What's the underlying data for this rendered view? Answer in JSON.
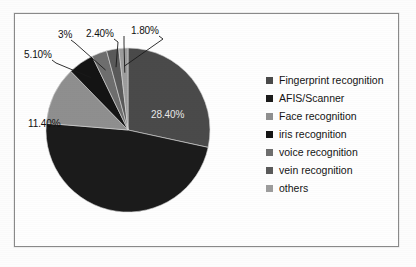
{
  "chart_data": {
    "type": "pie",
    "title": "",
    "legend_position": "right",
    "categories": [
      "Fingerprint recognition",
      "AFIS/Scanner",
      "Face recognition",
      "iris recognition",
      "voice recognition",
      "vein recognition",
      "others"
    ],
    "values": [
      28.4,
      47.9,
      11.4,
      5.1,
      3.0,
      2.4,
      1.8
    ],
    "value_labels": [
      "28.40%",
      "",
      "11.40%",
      "5.10%",
      "3%",
      "2.40%",
      "1.80%"
    ],
    "colors": [
      "#4a4a4a",
      "#1b1b1b",
      "#8f8f8f",
      "#141414",
      "#6e6e6e",
      "#5a5a5a",
      "#9d9d9d"
    ],
    "units": "percent",
    "total": 100
  },
  "chart": {
    "slices": [
      {
        "name": "Fingerprint recognition",
        "value": 28.4,
        "label": "28.40%",
        "color": "#4a4a4a",
        "label_x": 151,
        "label_y": 109,
        "label_placement": "inside"
      },
      {
        "name": "AFIS/Scanner",
        "value": 47.9,
        "label": "",
        "color": "#1b1b1b",
        "label_placement": "none"
      },
      {
        "name": "Face recognition",
        "value": 11.4,
        "label": "11.40%",
        "color": "#8f8f8f",
        "label_x": 28,
        "label_y": 118,
        "label_placement": "outside"
      },
      {
        "name": "iris recognition",
        "value": 5.1,
        "label": "5.10%",
        "color": "#141414",
        "label_x": 24,
        "label_y": 49,
        "label_placement": "outside"
      },
      {
        "name": "voice recognition",
        "value": 3.0,
        "label": "3%",
        "color": "#6e6e6e",
        "label_x": 58,
        "label_y": 29,
        "label_placement": "outside"
      },
      {
        "name": "vein recognition",
        "value": 2.4,
        "label": "2.40%",
        "color": "#5a5a5a",
        "label_x": 86,
        "label_y": 28,
        "label_placement": "outside"
      },
      {
        "name": "others",
        "value": 1.8,
        "label": "1.80%",
        "color": "#9d9d9d",
        "label_x": 131,
        "label_y": 25,
        "label_placement": "outside"
      }
    ]
  },
  "legend": {
    "items": [
      {
        "label": "Fingerprint recognition",
        "color": "#4a4a4a"
      },
      {
        "label": "AFIS/Scanner",
        "color": "#1b1b1b"
      },
      {
        "label": "Face recognition",
        "color": "#8f8f8f"
      },
      {
        "label": "iris recognition",
        "color": "#141414"
      },
      {
        "label": "voice recognition",
        "color": "#6e6e6e"
      },
      {
        "label": "vein recognition",
        "color": "#5a5a5a"
      },
      {
        "label": "others",
        "color": "#9d9d9d"
      }
    ]
  }
}
